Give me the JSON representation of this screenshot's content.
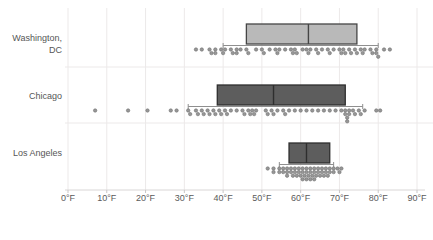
{
  "chart_data": {
    "type": "box",
    "title": "",
    "orientation": "horizontal",
    "grid": true,
    "legend": false,
    "x_axis": {
      "min": 0,
      "max": 90,
      "tick_step": 10,
      "unit": "°F",
      "tick_labels": [
        "0°F",
        "10°F",
        "20°F",
        "30°F",
        "40°F",
        "50°F",
        "60°F",
        "70°F",
        "80°F",
        "90°F"
      ]
    },
    "categories": [
      "Washington, DC",
      "Chicago",
      "Los Angeles"
    ],
    "series": [
      {
        "name": "Washington, DC",
        "box_fill": "#b9b9b9",
        "box_stroke": "#454545",
        "whisker_low": 40,
        "q1": 46,
        "median": 62,
        "q3": 74.5,
        "whisker_high": 80,
        "points": [
          33,
          34.5,
          36.5,
          37,
          38,
          38,
          39.5,
          40,
          40.5,
          42,
          42.5,
          43.5,
          43.5,
          44.5,
          46,
          46.5,
          48.5,
          50,
          50.5,
          52,
          53.5,
          54,
          54.5,
          56,
          57.5,
          58,
          58.5,
          59,
          60.5,
          61.5,
          62,
          62.5,
          64,
          64.5,
          65.5,
          67,
          67.5,
          68.5,
          70,
          70.5,
          71,
          71.5,
          72.5,
          73,
          74,
          74.5,
          75.5,
          76,
          76.5,
          78,
          78.5,
          79.5,
          79.5,
          80,
          81.5,
          83
        ]
      },
      {
        "name": "Chicago",
        "box_fill": "#5d5d5d",
        "box_stroke": "#2e2e2e",
        "whisker_low": 31,
        "q1": 38.5,
        "median": 53,
        "q3": 71.5,
        "whisker_high": 76,
        "points": [
          7,
          15.5,
          20.5,
          26.5,
          28,
          31,
          31.5,
          33,
          33.5,
          34.5,
          35,
          36,
          36.5,
          37.5,
          38,
          39,
          39.5,
          40.5,
          41,
          42,
          43.5,
          45,
          45.5,
          46.5,
          47,
          47.5,
          48,
          48.5,
          51,
          51.5,
          52.5,
          53,
          54,
          55.5,
          56,
          57,
          58.5,
          60,
          61.5,
          63,
          64.5,
          66,
          67.5,
          69,
          70.5,
          71.5,
          71.5,
          72,
          72,
          72.5,
          72.5,
          73.5,
          74,
          75,
          75.5,
          76.5,
          79.5,
          80.5
        ]
      },
      {
        "name": "Los Angeles",
        "box_fill": "#5d5d5d",
        "box_stroke": "#2e2e2e",
        "whisker_low": 54.5,
        "q1": 57,
        "median": 61.5,
        "q3": 67.5,
        "whisker_high": 68.5,
        "points": [
          51.5,
          53,
          53,
          54.5,
          54.5,
          55.5,
          55.5,
          56.5,
          56.5,
          56.5,
          57.5,
          57.5,
          58,
          58.5,
          58.5,
          59,
          59.5,
          59.5,
          60,
          60.5,
          60.5,
          60.5,
          61,
          61.5,
          61.5,
          61.5,
          62,
          62.5,
          62.5,
          62.5,
          63,
          63.5,
          63.5,
          63.5,
          64,
          64.5,
          64.5,
          65,
          65.5,
          65.5,
          66,
          66.5,
          66.5,
          67,
          67.5,
          67.5,
          68.5,
          68.5,
          69.5,
          70,
          70.5
        ]
      }
    ],
    "colors": {
      "whisker": "#8f8f8f",
      "dot_fill": "#979797",
      "dot_stroke": "#6e6e6e",
      "grid": "#ecE9e9",
      "axis_line": "#d9d6d6",
      "tick_mark": "#c9c6c6",
      "label_text": "#565656"
    }
  }
}
